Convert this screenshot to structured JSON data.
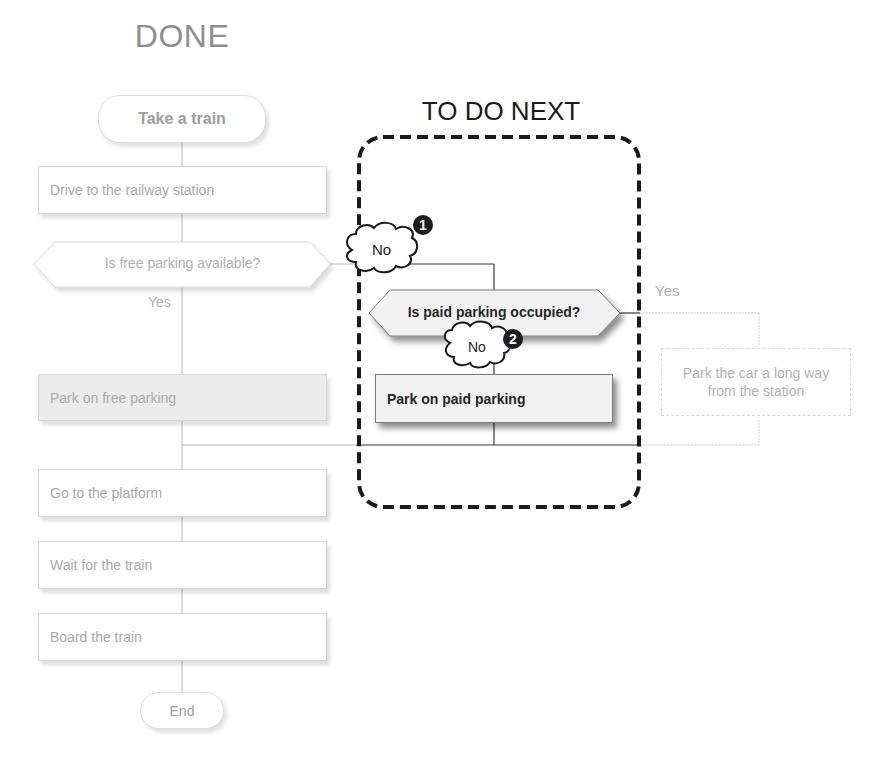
{
  "headings": {
    "done": "DONE",
    "to_do_next": "TO DO NEXT"
  },
  "done_flow": {
    "start": "Take a train",
    "steps": [
      "Drive to the railway station",
      "Is free parking available?",
      "Park on free parking",
      "Go to the platform",
      "Wait for the train",
      "Board the train"
    ],
    "yes_label": "Yes",
    "end": "End"
  },
  "next_flow": {
    "no_label_1": "No",
    "badge_1": "1",
    "decision": "Is paid parking occupied?",
    "no_label_2": "No",
    "badge_2": "2",
    "action": "Park on paid parking",
    "yes_label": "Yes",
    "alternative": "Park the car a long way from the station"
  },
  "colors": {
    "done_text": "#a9a9a9",
    "active_text": "#262626",
    "dashed_frame": "#1a1a1a",
    "shaded_box": "#ececec"
  }
}
